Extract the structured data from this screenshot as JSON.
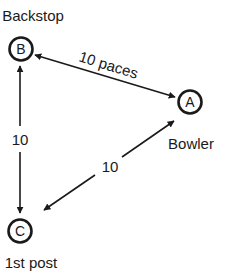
{
  "diagram": {
    "colors": {
      "ink": "#1a1a1a",
      "background": "#ffffff"
    },
    "nodes": [
      {
        "id": "B",
        "letter": "B",
        "label": "Backstop"
      },
      {
        "id": "A",
        "letter": "A",
        "label": "Bowler"
      },
      {
        "id": "C",
        "letter": "C",
        "label": "1st post"
      }
    ],
    "edges": [
      {
        "from": "B",
        "to": "A",
        "label": "10 paces",
        "arrows": "both"
      },
      {
        "from": "B",
        "to": "C",
        "label": "10",
        "arrows": "both"
      },
      {
        "from": "C",
        "to": "A",
        "label": "10",
        "arrows": "both"
      }
    ]
  }
}
